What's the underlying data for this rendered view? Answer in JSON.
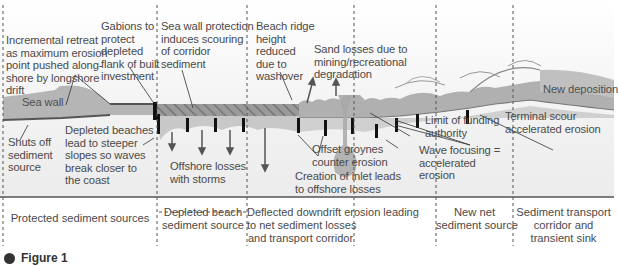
{
  "diagram": {
    "colors": {
      "land": "#b3b3b3",
      "beach": "#cfcfcf",
      "shore_line": "#6b6b6b",
      "groyne": "#111111",
      "hatch": "#8a8a8a",
      "text": "#4a4a4a",
      "divider": "#555555"
    },
    "annotations": {
      "incremental_retreat": [
        "Incremental retreat",
        "as maximum erosion",
        "point pushed along-",
        "shore by longshore",
        "drift"
      ],
      "gabions": [
        "Gabions to",
        "protect",
        "depleted",
        "flank of built",
        "investment"
      ],
      "sea_wall_protection": [
        "Sea wall protection",
        "induces scouring",
        "of corridor",
        "sediment"
      ],
      "beach_ridge": [
        "Beach ridge",
        "height",
        "reduced",
        "due to",
        "washover"
      ],
      "sand_losses": [
        "Sand losses due to",
        "mining/recreational",
        "degradation"
      ],
      "sea_wall": "Sea wall",
      "shuts_off": [
        "Shuts off",
        "sediment",
        "source"
      ],
      "depleted_beaches": [
        "Depleted beaches",
        "lead to steeper",
        "slopes so waves",
        "break closer to",
        "the coast"
      ],
      "offshore_losses": [
        "Offshore losses",
        "with storms"
      ],
      "offset_groynes": [
        "Offset groynes",
        "counter erosion"
      ],
      "creation_inlet": [
        "Creation of inlet leads",
        "to offshore losses"
      ],
      "limit_funding": [
        "Limit of funding",
        "authority"
      ],
      "wave_focusing": [
        "Wave focusing =",
        "accelerated",
        "erosion"
      ],
      "terminal_scour": [
        "Terminal scour",
        "accelerated erosion"
      ],
      "new_deposition": "New deposition"
    },
    "zones": [
      {
        "label": [
          "Protected sediment sources"
        ]
      },
      {
        "label": [
          "Depleted beach",
          "sediment source"
        ]
      },
      {
        "label": [
          "Deflected downdrift erosion leading",
          "to net sediment losses",
          "and transport corridor"
        ]
      },
      {
        "label": [
          "New net",
          "sediment source"
        ]
      },
      {
        "label": [
          "Sediment transport",
          "corridor and",
          "transient sink"
        ]
      }
    ],
    "caption": {
      "label": "Figure 1"
    }
  }
}
